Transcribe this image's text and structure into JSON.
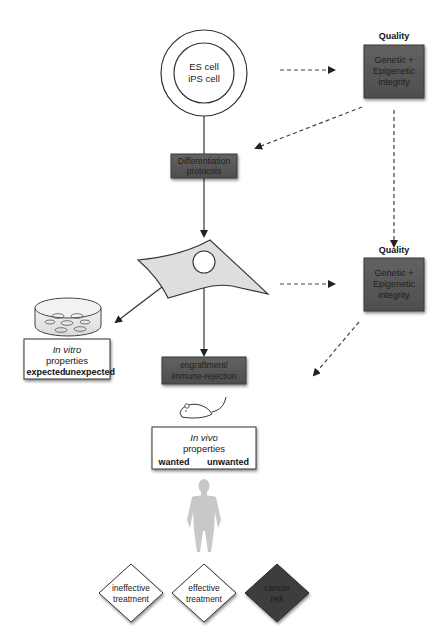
{
  "diagram": {
    "source_cell": {
      "line1": "ES cell",
      "line2": "iPS cell"
    },
    "quality_top": {
      "heading": "Quality",
      "line1": "Genetic +",
      "line2": "Epigenetic",
      "line3": "integrity"
    },
    "differentiation": {
      "line1": "Differentiation",
      "line2": "protocols"
    },
    "quality_mid": {
      "heading": "Quality",
      "line1": "Genetic +",
      "line2": "Epigenetic",
      "line3": "integrity"
    },
    "in_vitro": {
      "title": "In vitro",
      "subtitle": "properties",
      "left": "expected",
      "right": "unexpected"
    },
    "engraftment": {
      "line1": "engraftment/",
      "line2": "immune-rejection"
    },
    "in_vivo": {
      "title": "In vivo",
      "subtitle": "properties",
      "left": "wanted",
      "right": "unwanted"
    },
    "outcomes": [
      {
        "line1": "ineffective",
        "line2": "treatment",
        "style": "light"
      },
      {
        "line1": "effective",
        "line2": "treatment",
        "style": "light"
      },
      {
        "line1": "cancer",
        "line2": "risk",
        "style": "dark"
      }
    ],
    "icons": {
      "petri_dish": "petri-dish-icon",
      "differentiated_cell": "differentiated-cell-icon",
      "mouse": "mouse-icon",
      "human": "human-silhouette-icon"
    },
    "colors": {
      "dark_box": "#5a5a5a",
      "cell_fill": "#dedede",
      "human_fill": "#c8c8c8",
      "cancer_fill": "#3c3c3c",
      "line": "#333333"
    }
  }
}
